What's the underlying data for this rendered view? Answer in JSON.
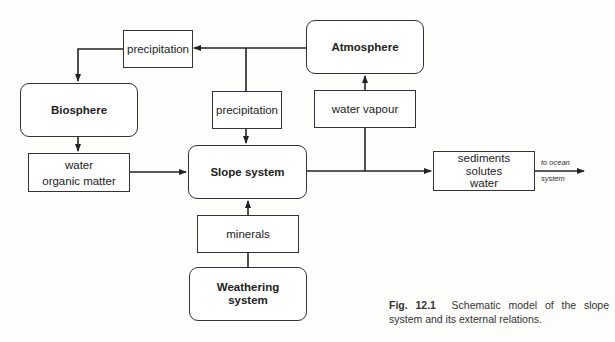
{
  "diagram": {
    "nodes": {
      "atmosphere": "Atmosphere",
      "biosphere": "Biosphere",
      "slope_system": "Slope system",
      "weathering_line1": "Weathering",
      "weathering_line2": "system"
    },
    "flows": {
      "precipitation_top": "precipitation",
      "precipitation_mid": "precipitation",
      "water_vapour": "water vapour",
      "bio_out_line1": "water",
      "bio_out_line2": "organic matter",
      "minerals": "minerals",
      "out_line1": "sediments",
      "out_line2": "solutes",
      "out_line3": "water"
    },
    "ocean_label_line1": "to ocean",
    "ocean_label_line2": "system"
  },
  "caption": {
    "fig": "Fig. 12.1",
    "text": "Schematic model of the slope system and its external relations."
  }
}
